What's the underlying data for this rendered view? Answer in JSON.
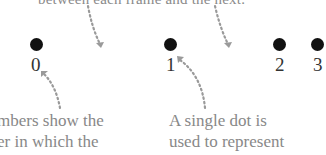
{
  "diagram": {
    "top_caption": "between each frame and the next.",
    "frames": [
      {
        "label": "0"
      },
      {
        "label": "1"
      },
      {
        "label": "2"
      },
      {
        "label": "3"
      }
    ],
    "captions": {
      "left": {
        "line1": "mbers show the",
        "line2": "er in which the"
      },
      "right": {
        "line1": "A single dot is",
        "line2": "used to represent"
      }
    },
    "colors": {
      "dot": "#111111",
      "arrow": "#999999",
      "caption_text": "#888888",
      "number_text": "#333333"
    }
  }
}
